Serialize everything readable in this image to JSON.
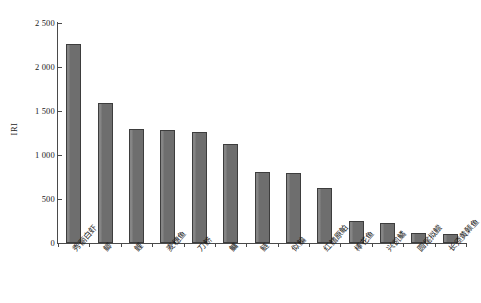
{
  "chart_data": {
    "type": "bar",
    "title": "",
    "xlabel": "",
    "ylabel": "IRI",
    "ylim": [
      0,
      2500
    ],
    "ytick_labels": [
      "0",
      "500",
      "1 000",
      "1 500",
      "2 000",
      "2 500"
    ],
    "ytick_values": [
      0,
      500,
      1000,
      1500,
      2000,
      2500
    ],
    "grid": false,
    "legend": "none",
    "bar_color": "#6e6e6e",
    "bar_edge_color": "#3d3d3d",
    "axis_color": "#4a4a4a",
    "categories": [
      "秀丽白虾",
      "鲫",
      "鲤",
      "麦穗鱼",
      "刀鲚",
      "鳙",
      "鲢",
      "似鳊",
      "红鳍原鲌",
      "棒花鱼",
      "兴凯鱊",
      "圆尾拟鲿",
      "长须黄颡鱼"
    ],
    "values": [
      2265,
      1590,
      1290,
      1285,
      1265,
      1120,
      805,
      790,
      630,
      250,
      225,
      110,
      105
    ]
  }
}
